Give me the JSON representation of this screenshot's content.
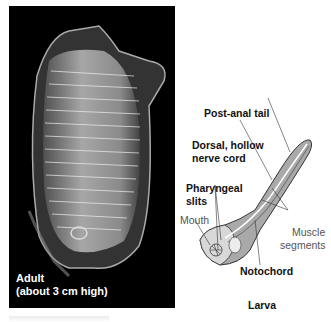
{
  "figure": {
    "adult_panel": {
      "caption_line1": "Adult",
      "caption_line2": "(about 3 cm high)",
      "background": "#000000"
    },
    "larva_panel": {
      "title": "Larva",
      "labels": {
        "post_anal_tail": "Post-anal tail",
        "nerve_cord_line1": "Dorsal, hollow",
        "nerve_cord_line2": "nerve cord",
        "pharyngeal_line1": "Pharyngeal",
        "pharyngeal_line2": "slits",
        "mouth": "Mouth",
        "muscle_line1": "Muscle",
        "muscle_line2": "segments",
        "notochord": "Notochord"
      },
      "colors": {
        "body": "#a9a9a9",
        "outline": "#333333",
        "head": "#d8d8d8"
      }
    }
  }
}
